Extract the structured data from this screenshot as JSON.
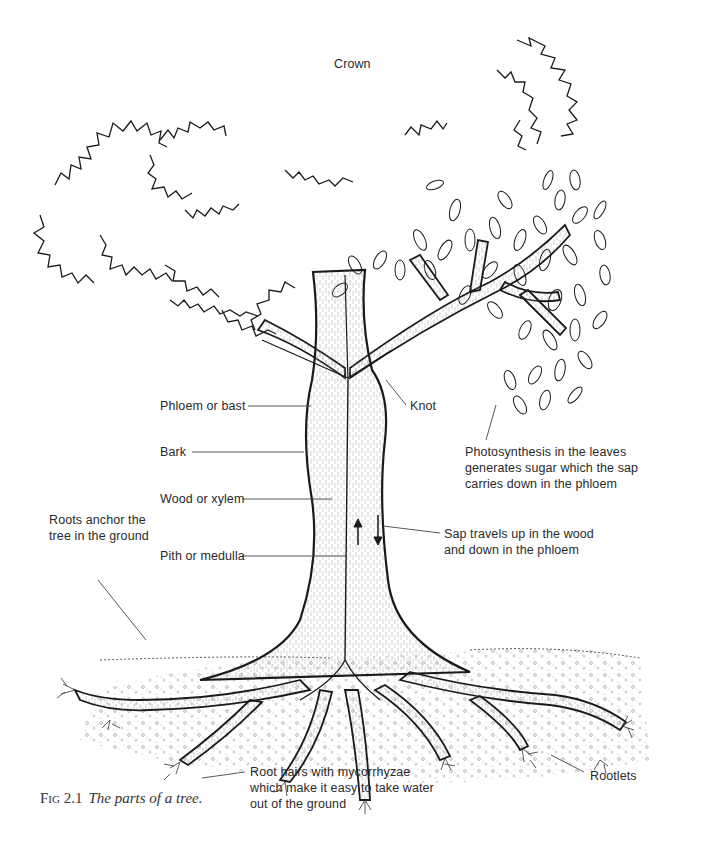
{
  "figure": {
    "number": "Fig 2.1",
    "title": "The parts of a tree."
  },
  "labels": {
    "crown": "Crown",
    "phloem": "Phloem or bast",
    "bark": "Bark",
    "wood": "Wood or xylem",
    "pith": "Pith or medulla",
    "knot": "Knot",
    "photosynthesis": [
      "Photosynthesis in the leaves",
      "generates sugar which the sap",
      "carries down in the phloem"
    ],
    "sap": [
      "Sap travels up in the wood",
      "and down in the phloem"
    ],
    "roots_anchor": [
      "Roots anchor the",
      "tree in the ground"
    ],
    "root_hairs": [
      "Root hairs with mycorrhyzae",
      "which make it easy to take water",
      "out of the ground"
    ],
    "rootlets": "Rootlets"
  },
  "colors": {
    "ink": "#1a1a1a",
    "label_text": "#2a2a2a",
    "leader_line": "#444444",
    "background": "#ffffff"
  }
}
